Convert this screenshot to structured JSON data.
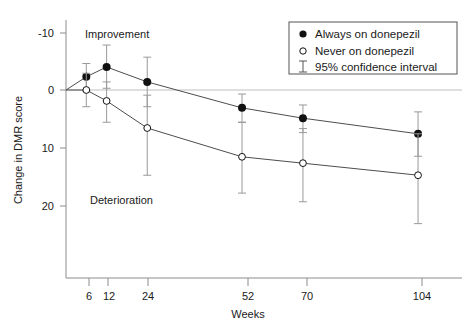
{
  "chart_data": {
    "type": "line",
    "title": "",
    "xlabel": "Weeks",
    "ylabel": "Change in DMR score",
    "x": [
      6,
      12,
      24,
      52,
      70,
      104
    ],
    "xtick_labels": [
      "6",
      "12",
      "24",
      "52",
      "70",
      "104"
    ],
    "ytick_labels": [
      "-10",
      "0",
      "10",
      "20"
    ],
    "ytick_values": [
      -10,
      0,
      10,
      20
    ],
    "ylim": [
      -12,
      26
    ],
    "xlim": [
      0,
      112
    ],
    "y_axis_inverted": true,
    "grid": false,
    "zero_line": true,
    "legend_position": "top-right",
    "annotations": [
      {
        "text": "Improvement",
        "x": 12,
        "y": -9.3
      },
      {
        "text": "Deterioration",
        "x": 14,
        "y": 18.5
      }
    ],
    "series": [
      {
        "name": "Always on donepezil",
        "marker": "filled-circle",
        "origin": {
          "x": 0,
          "y": 0
        },
        "values": [
          -2.3,
          -4.0,
          -1.4,
          3.1,
          4.9,
          7.6
        ],
        "ci_low": [
          -4.6,
          -7.8,
          -5.7,
          0.7,
          2.6,
          3.8
        ],
        "ci_high": [
          0.2,
          -0.3,
          2.9,
          5.6,
          7.4,
          11.5
        ]
      },
      {
        "name": "Never on donepezil",
        "marker": "open-circle",
        "origin": {
          "x": 0,
          "y": 0
        },
        "values": [
          0.0,
          1.9,
          6.6,
          11.6,
          12.7,
          14.8
        ],
        "ci_low": [
          -2.9,
          -1.4,
          0.9,
          5.6,
          6.7,
          7.6
        ],
        "ci_high": [
          2.9,
          5.6,
          14.8,
          17.9,
          19.4,
          23.2
        ]
      }
    ]
  },
  "legend": {
    "items": [
      {
        "label": "Always on donepezil",
        "marker": "filled-circle"
      },
      {
        "label": "Never on donepezil",
        "marker": "open-circle"
      },
      {
        "label": "95% confidence interval",
        "marker": "error-bar"
      }
    ]
  },
  "colors": {
    "ink": "#1a1a1a",
    "axis": "#8c8c8c",
    "line": "#4d4d4d",
    "errorbar": "#999999",
    "zero_line": "#bfbfbf"
  }
}
